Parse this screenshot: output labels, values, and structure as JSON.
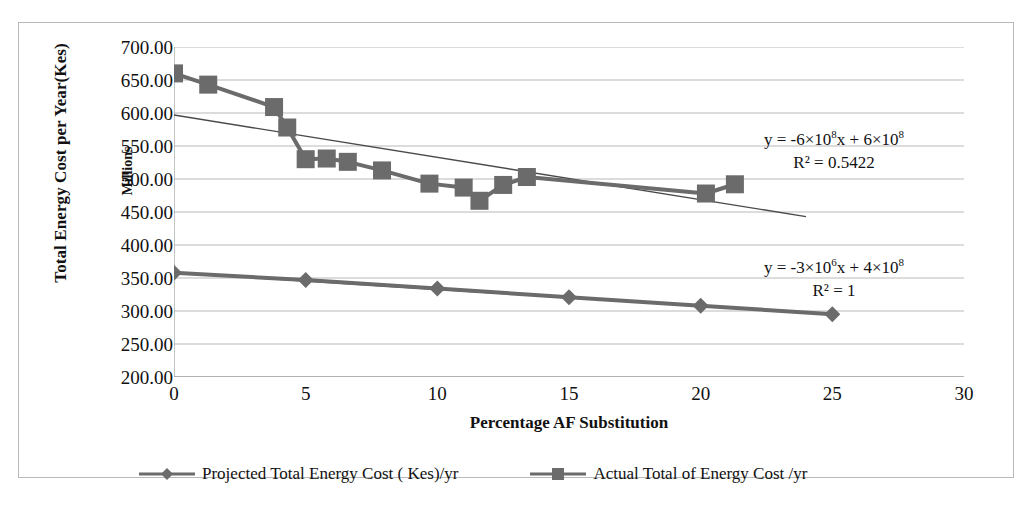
{
  "chart_data": {
    "type": "line",
    "title": "",
    "xlabel": "Percentage AF Substitution",
    "ylabel": "Total Energy Cost per Year(Kes)",
    "y_unit_label": "Millions",
    "xlim": [
      0,
      30
    ],
    "ylim": [
      200,
      700
    ],
    "xticks": [
      0,
      5,
      10,
      15,
      20,
      25,
      30
    ],
    "yticks": [
      "200.00",
      "250.00",
      "300.00",
      "350.00",
      "400.00",
      "450.00",
      "500.00",
      "550.00",
      "600.00",
      "650.00",
      "700.00"
    ],
    "grid": true,
    "legend_position": "bottom",
    "series": [
      {
        "name": "Projected Total Energy  Cost ( Kes)/yr",
        "marker": "diamond",
        "color": "#6b6b6b",
        "points": [
          {
            "x": 0.0,
            "y": 358
          },
          {
            "x": 5.0,
            "y": 347
          },
          {
            "x": 10.0,
            "y": 334
          },
          {
            "x": 15.0,
            "y": 321
          },
          {
            "x": 20.0,
            "y": 308
          },
          {
            "x": 25.0,
            "y": 295
          }
        ]
      },
      {
        "name": "Actual Total of Energy Cost /yr",
        "marker": "square",
        "color": "#6b6b6b",
        "points": [
          {
            "x": 0.0,
            "y": 660
          },
          {
            "x": 1.3,
            "y": 643
          },
          {
            "x": 3.8,
            "y": 609
          },
          {
            "x": 4.3,
            "y": 578
          },
          {
            "x": 5.0,
            "y": 530
          },
          {
            "x": 5.8,
            "y": 531
          },
          {
            "x": 6.6,
            "y": 526
          },
          {
            "x": 7.9,
            "y": 513
          },
          {
            "x": 9.7,
            "y": 493
          },
          {
            "x": 11.0,
            "y": 487
          },
          {
            "x": 11.6,
            "y": 467
          },
          {
            "x": 12.5,
            "y": 491
          },
          {
            "x": 13.4,
            "y": 503
          },
          {
            "x": 20.2,
            "y": 478
          },
          {
            "x": 21.3,
            "y": 492
          }
        ]
      }
    ],
    "trendlines": [
      {
        "for_series": "Actual Total of Energy Cost /yr",
        "equation": "y = -6×10⁸x + 6×10⁸",
        "equation_html": "y = -6×10<sup>8</sup>x + 6×10<sup>8</sup>",
        "r_squared_label": "R² = 0.5422",
        "r_squared": 0.5422,
        "x0": 0.0,
        "y0": 597,
        "x1": 24.0,
        "y1": 443
      },
      {
        "for_series": "Projected Total Energy  Cost ( Kes)/yr",
        "equation": "y = -3×10⁶x + 4×10⁸",
        "equation_html": "y = -3×10<sup>6</sup>x + 4×10<sup>8</sup>",
        "r_squared_label": "R² = 1",
        "r_squared": 1,
        "x0": 0.0,
        "y0": 358,
        "x1": 25.0,
        "y1": 295
      }
    ]
  },
  "axes": {
    "y_title": "Total Energy Cost per Year(Kes)",
    "y_unit": "Millions",
    "x_title": "Percentage AF Substitution",
    "yticks": [
      "700.00",
      "650.00",
      "600.00",
      "550.00",
      "500.00",
      "450.00",
      "400.00",
      "350.00",
      "300.00",
      "250.00",
      "200.00"
    ],
    "xticks": [
      "0",
      "5",
      "10",
      "15",
      "20",
      "25",
      "30"
    ]
  },
  "annotations": {
    "eq1_line1": "y = -6×10⁸x + 6×10⁸",
    "eq1_line2": "R² = 0.5422",
    "eq2_line1": "y = -3×10⁶x + 4×10⁸",
    "eq2_line2": "R² = 1"
  },
  "legend": {
    "items": [
      {
        "label": "Projected Total Energy  Cost ( Kes)/yr",
        "marker": "diamond-marker-icon",
        "color": "#6b6b6b"
      },
      {
        "label": "Actual Total of Energy Cost /yr",
        "marker": "square-marker-icon",
        "color": "#6b6b6b"
      }
    ]
  },
  "colors": {
    "series_gray": "#6b6b6b",
    "series_dark": "#555555",
    "grid": "#b9b9b9",
    "axis": "#8a8a8a",
    "frame": "#b9b9b9",
    "text": "#111111"
  }
}
